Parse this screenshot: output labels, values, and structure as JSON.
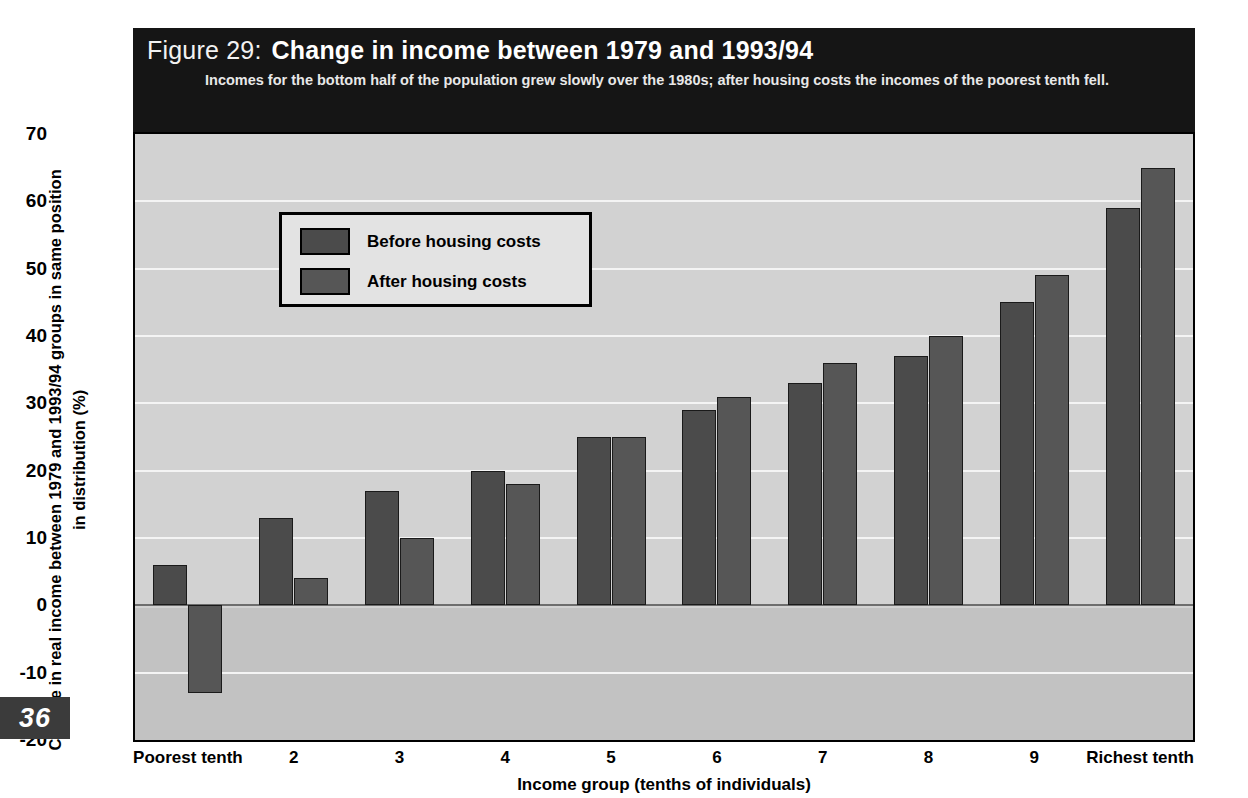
{
  "figure": {
    "number_label": "Figure 29:",
    "title": "Change in income between 1979 and 1993/94",
    "subtitle": "Incomes for the bottom half of the population grew slowly over the 1980s; after housing costs the incomes of the poorest tenth fell.",
    "page_number": "36"
  },
  "legend": {
    "position": "inside-top-left",
    "entries": [
      {
        "label": "Before housing costs",
        "color": "#4b4b4b"
      },
      {
        "label": "After housing costs",
        "color": "#565656"
      }
    ]
  },
  "colors": {
    "banner_bg": "#151515",
    "plot_bg_positive": "#d2d2d2",
    "plot_bg_negative": "#c2c2c2",
    "gridline": "#f4f4f4",
    "zeroline": "#6d6d6d",
    "before_bar": "#4b4b4b",
    "after_bar": "#565656",
    "axis": "#000000",
    "page_badge_bg": "#3b3b3b"
  },
  "chart_data": {
    "type": "bar",
    "title": "Change in income between 1979 and 1993/94",
    "subtitle": "Incomes for the bottom half of the population grew slowly over the 1980s; after housing costs the incomes of the poorest tenth fell.",
    "xlabel": "Income group (tenths of individuals)",
    "ylabel": "Change in real income between 1979 and 1993/94 groups in same position in distribution (%)",
    "categories": [
      "Poorest tenth",
      "2",
      "3",
      "4",
      "5",
      "6",
      "7",
      "8",
      "9",
      "Richest tenth"
    ],
    "series": [
      {
        "name": "Before housing costs",
        "values": [
          6,
          13,
          17,
          20,
          25,
          29,
          33,
          37,
          45,
          59
        ]
      },
      {
        "name": "After housing costs",
        "values": [
          -13,
          4,
          10,
          18,
          25,
          31,
          36,
          40,
          49,
          65
        ]
      }
    ],
    "ylim": [
      -20,
      70
    ],
    "yticks": [
      70,
      60,
      50,
      40,
      30,
      20,
      10,
      0,
      -10,
      -20
    ],
    "ytick_labels": [
      "70",
      "60",
      "50",
      "40",
      "30",
      "20",
      "10",
      "0",
      "-10",
      "-20"
    ],
    "grid": true,
    "legend_position": "upper left"
  }
}
